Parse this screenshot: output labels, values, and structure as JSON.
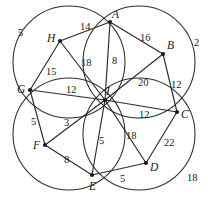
{
  "figure": {
    "stroke_color": "#2b2b2b",
    "vertex_color": "#1a1a1a",
    "background": "#ffffff",
    "width": 208,
    "height": 204
  },
  "vertices": [
    {
      "id": "A",
      "label": "A",
      "x": 110,
      "y": 22,
      "label_x": 112,
      "label_y": 9
    },
    {
      "id": "B",
      "label": "B",
      "x": 163,
      "y": 54,
      "label_x": 167,
      "label_y": 40
    },
    {
      "id": "C",
      "label": "C",
      "x": 177,
      "y": 112,
      "label_x": 181,
      "label_y": 109
    },
    {
      "id": "D",
      "label": "D",
      "x": 146,
      "y": 163,
      "label_x": 150,
      "label_y": 162
    },
    {
      "id": "E",
      "label": "E",
      "x": 92,
      "y": 175,
      "label_x": 89,
      "label_y": 181
    },
    {
      "id": "F",
      "label": "F",
      "x": 45,
      "y": 145,
      "label_x": 33,
      "label_y": 140
    },
    {
      "id": "G",
      "label": "G",
      "x": 30,
      "y": 90,
      "label_x": 17,
      "label_y": 84
    },
    {
      "id": "H",
      "label": "H",
      "x": 60,
      "y": 41,
      "label_x": 47,
      "label_y": 33
    },
    {
      "id": "I",
      "label": "I",
      "x": 105,
      "y": 100,
      "label_x": 106,
      "label_y": 86
    }
  ],
  "edges": [
    {
      "from": "H",
      "to": "A",
      "weight": "14",
      "label_x": 80,
      "label_y": 22
    },
    {
      "from": "A",
      "to": "B",
      "weight": "16",
      "label_x": 140,
      "label_y": 33
    },
    {
      "from": "B",
      "to": "C",
      "weight": "12",
      "label_x": 171,
      "label_y": 80
    },
    {
      "from": "C",
      "to": "D",
      "weight": "22",
      "label_x": 164,
      "label_y": 138
    },
    {
      "from": "D",
      "to": "E",
      "weight": "5",
      "label_x": 120,
      "label_y": 174
    },
    {
      "from": "E",
      "to": "F",
      "weight": "8",
      "label_x": 64,
      "label_y": 155
    },
    {
      "from": "F",
      "to": "G",
      "weight": "5",
      "label_x": 31,
      "label_y": 117
    },
    {
      "from": "G",
      "to": "H",
      "weight": "15",
      "label_x": 46,
      "label_y": 67
    },
    {
      "from": "I",
      "to": "A",
      "weight": "8",
      "label_x": 112,
      "label_y": 56
    },
    {
      "from": "I",
      "to": "B",
      "weight": "20",
      "label_x": 138,
      "label_y": 78
    },
    {
      "from": "I",
      "to": "C",
      "weight": "12",
      "label_x": 139,
      "label_y": 110
    },
    {
      "from": "I",
      "to": "D",
      "weight": "18",
      "label_x": 126,
      "label_y": 131
    },
    {
      "from": "I",
      "to": "E",
      "weight": "5",
      "label_x": 99,
      "label_y": 136
    },
    {
      "from": "I",
      "to": "F",
      "weight": "3",
      "label_x": 64,
      "label_y": 118
    },
    {
      "from": "I",
      "to": "G",
      "weight": "12",
      "label_x": 66,
      "label_y": 85
    },
    {
      "from": "I",
      "to": "H",
      "weight": "18",
      "label_x": 81,
      "label_y": 58
    }
  ],
  "circles": [
    {
      "id": "top-left",
      "cx": 69,
      "cy": 62,
      "r": 56,
      "outer_weight": "5",
      "weight_x": 18,
      "weight_y": 28
    },
    {
      "id": "top-right",
      "cx": 139,
      "cy": 62,
      "r": 56,
      "outer_weight": "2",
      "weight_x": 194,
      "weight_y": 38
    },
    {
      "id": "bottom-left",
      "cx": 69,
      "cy": 134,
      "r": 56,
      "outer_weight": null,
      "weight_x": null,
      "weight_y": null
    },
    {
      "id": "bottom-right",
      "cx": 139,
      "cy": 134,
      "r": 56,
      "outer_weight": "18",
      "weight_x": 187,
      "weight_y": 173
    }
  ],
  "outer_labels": [
    {
      "text": "5",
      "x": 18,
      "y": 28
    },
    {
      "text": "2",
      "x": 194,
      "y": 38
    },
    {
      "text": "18",
      "x": 187,
      "y": 173
    }
  ],
  "chart_data": {
    "type": "diagram",
    "node_labels": [
      "A",
      "B",
      "C",
      "D",
      "E",
      "F",
      "G",
      "H",
      "I"
    ],
    "outer_ring_edges": [
      {
        "pair": "H-A",
        "value": 14
      },
      {
        "pair": "A-B",
        "value": 16
      },
      {
        "pair": "B-C",
        "value": 12
      },
      {
        "pair": "C-D",
        "value": 22
      },
      {
        "pair": "D-E",
        "value": 5
      },
      {
        "pair": "E-F",
        "value": 8
      },
      {
        "pair": "F-G",
        "value": 5
      },
      {
        "pair": "G-H",
        "value": 15
      }
    ],
    "spoke_edges": [
      {
        "pair": "I-A",
        "value": 8
      },
      {
        "pair": "I-B",
        "value": 20
      },
      {
        "pair": "I-C",
        "value": 12
      },
      {
        "pair": "I-D",
        "value": 18
      },
      {
        "pair": "I-E",
        "value": 5
      },
      {
        "pair": "I-F",
        "value": 3
      },
      {
        "pair": "I-G",
        "value": 12
      },
      {
        "pair": "I-H",
        "value": 18
      }
    ],
    "annotations_outside_circles": [
      5,
      2,
      18
    ],
    "legend": "none",
    "grid": false
  }
}
